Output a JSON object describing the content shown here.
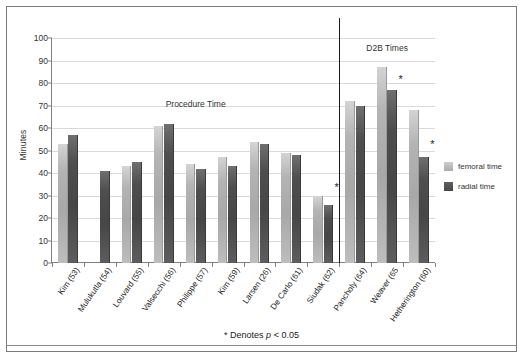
{
  "chart_data": {
    "type": "bar",
    "title": "",
    "xlabel": "",
    "ylabel": "Minutes",
    "ylim": [
      0,
      100
    ],
    "ytick_step": 10,
    "yticks": [
      100,
      90,
      80,
      70,
      60,
      50,
      40,
      30,
      20,
      10,
      0
    ],
    "grid": true,
    "legend_position": "right",
    "categories": [
      "Kim (53)",
      "Mulukutla (54)",
      "Louvard (55)",
      "Valsecchi (56)",
      "Philippe (57)",
      "Kim (59)",
      "Larsen (26)",
      "De Carlo (61)",
      "Siudak (62)",
      "Pancholy (64)",
      "Weaver (65",
      "Hetherington (60)"
    ],
    "series": [
      {
        "name": "femoral time",
        "color": "#b4b4b4",
        "values": [
          53,
          null,
          43,
          61,
          44,
          47,
          54,
          49,
          30,
          72,
          87,
          68
        ]
      },
      {
        "name": "radial time",
        "color": "#4e4e4e",
        "values": [
          57,
          41,
          45,
          62,
          42,
          43,
          53,
          48,
          26,
          70,
          77,
          47
        ]
      }
    ],
    "annotations": [
      {
        "text": "*",
        "category": "Siudak (62)",
        "y": 36
      },
      {
        "text": "*",
        "category": "Weaver (65",
        "y": 84
      },
      {
        "text": "*",
        "category": "Hetherington (60)",
        "y": 55
      }
    ],
    "section_labels": [
      {
        "text": "Procedure Time",
        "start_category": "Kim (53)",
        "end_category": "Siudak (62)",
        "y": 73
      },
      {
        "text": "D2B Times",
        "start_category": "Pancholy (64)",
        "end_category": "Hetherington (60)",
        "y": 98
      }
    ],
    "divider_after_category": "Siudak (62)",
    "footnote": "* Denotes p < 0.05",
    "footnote_parts": {
      "before": "* Denotes ",
      "italic": "p",
      "after": " < 0.05"
    }
  }
}
